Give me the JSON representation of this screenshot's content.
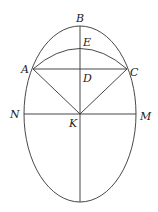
{
  "diagram": {
    "type": "geometry",
    "stroke_color": "#333333",
    "label_color": "#222222",
    "points": {
      "B": {
        "label": "B",
        "x": 80,
        "y": 27
      },
      "E": {
        "label": "E",
        "x": 80,
        "y": 48
      },
      "A": {
        "label": "A",
        "x": 33,
        "y": 69
      },
      "C": {
        "label": "C",
        "x": 127,
        "y": 69
      },
      "D": {
        "label": "D",
        "x": 80,
        "y": 69
      },
      "N": {
        "label": "N",
        "x": 24,
        "y": 114
      },
      "M": {
        "label": "M",
        "x": 136,
        "y": 114
      },
      "K": {
        "label": "K",
        "x": 80,
        "y": 114
      }
    },
    "ellipse": {
      "cx": 80,
      "cy": 114,
      "rx": 56,
      "ry": 88
    },
    "segments": [
      "AC",
      "NM",
      "BK-bottom",
      "AK",
      "CK"
    ],
    "arcs": [
      "AEC"
    ]
  }
}
